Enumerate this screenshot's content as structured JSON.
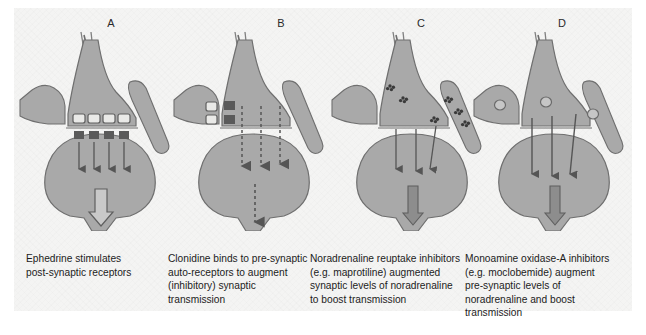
{
  "figure": {
    "background_color": "#f4f4f3",
    "cell_fill_color": "#a9a9a9",
    "cell_stroke_color": "#6f6f6f",
    "arrow_color": "#555555",
    "receptor_fill_color": "#5a5a5a"
  },
  "panels": [
    {
      "label": "A",
      "label_x": 91,
      "x": 18,
      "caption_x": 26,
      "vesicles": {
        "style": "open",
        "count": 4
      },
      "receptors": {
        "style": "filled",
        "count": 4
      },
      "cleft_arrows": {
        "style": "solid",
        "count": 4
      },
      "output_arrow": {
        "style": "hollow"
      },
      "caption_lines": [
        "Ephedrine stimulates",
        "post-synaptic receptors"
      ]
    },
    {
      "label": "B",
      "label_x": 261,
      "x": 172,
      "caption_x": 168,
      "vesicles": {
        "style": "mixed-open-filled",
        "count": 4
      },
      "receptors": {
        "style": "none",
        "count": 0
      },
      "cleft_arrows": {
        "style": "dashed",
        "count": 3
      },
      "output_arrow": {
        "style": "dashed"
      },
      "caption_lines": [
        "Clonidine binds to pre-synaptic",
        "auto-receptors to augment",
        "(inhibitory) synaptic",
        "transmission"
      ]
    },
    {
      "label": "C",
      "label_x": 401,
      "x": 330,
      "caption_x": 310,
      "vesicles": {
        "style": "dot-cluster",
        "count": 6
      },
      "receptors": {
        "style": "none",
        "count": 0
      },
      "cleft_arrows": {
        "style": "solid",
        "count": 3
      },
      "output_arrow": {
        "style": "filled"
      },
      "caption_lines": [
        "Noradrenaline reuptake inhibitors",
        "(e.g. maprotiline) augmented",
        "synaptic levels of noradrenaline",
        "to boost transmission"
      ]
    },
    {
      "label": "D",
      "label_x": 542,
      "x": 472,
      "caption_x": 465,
      "vesicles": {
        "style": "open-circle",
        "count": 3
      },
      "receptors": {
        "style": "none",
        "count": 0
      },
      "cleft_arrows": {
        "style": "solid",
        "count": 3
      },
      "output_arrow": {
        "style": "filled"
      },
      "caption_lines": [
        "Monoamine oxidase-A inhibitors",
        "(e.g. moclobemide) augment",
        "pre-synaptic levels of",
        "noradrenaline and boost",
        "transmission"
      ]
    }
  ]
}
